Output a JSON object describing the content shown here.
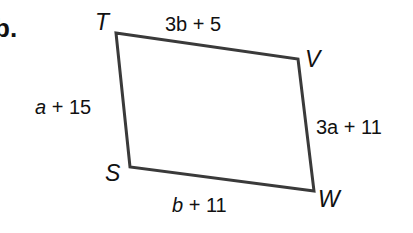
{
  "problem_label": "b.",
  "shape": "quadrilateral",
  "vertices": {
    "T": {
      "label": "T",
      "x": 116,
      "y": 33
    },
    "V": {
      "label": "V",
      "x": 298,
      "y": 59
    },
    "W": {
      "label": "W",
      "x": 314,
      "y": 191
    },
    "S": {
      "label": "S",
      "x": 130,
      "y": 167
    }
  },
  "sides": {
    "TV": {
      "var": "3b",
      "rest": " + 5"
    },
    "VW": {
      "var": "3a",
      "rest": " + 11"
    },
    "SW": {
      "var": "b",
      "rest": " + 11"
    },
    "TS": {
      "var": "a",
      "rest": " + 15"
    }
  },
  "colors": {
    "stroke": "#3a3a3a",
    "text": "#111111"
  }
}
